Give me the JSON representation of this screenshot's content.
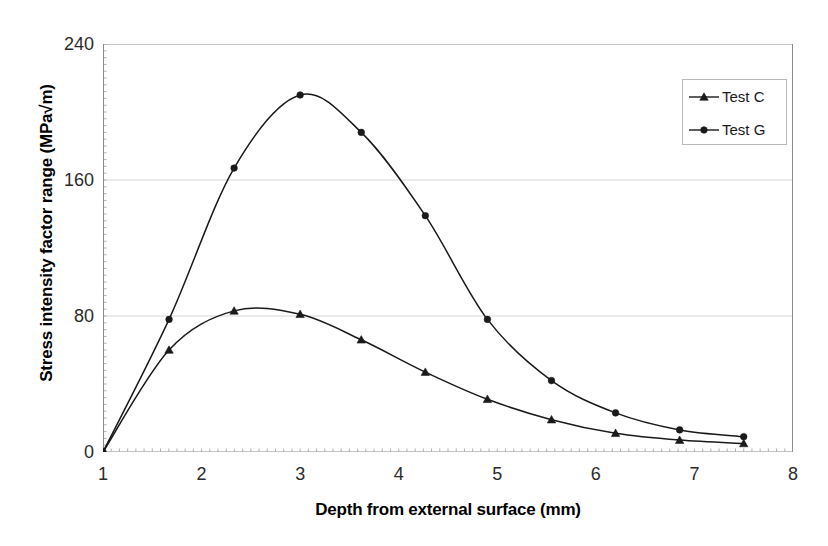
{
  "chart_data": {
    "type": "line",
    "title": "",
    "xlabel": "Depth from external surface (mm)",
    "ylabel": "Stress intensity factor range (MPa√m)",
    "xlim": [
      1,
      8
    ],
    "ylim": [
      0,
      240
    ],
    "xticks": [
      1,
      2,
      3,
      4,
      5,
      6,
      7,
      8
    ],
    "xtick_labels": [
      "1",
      "2",
      "3",
      "4",
      "5",
      "6",
      "7",
      "8"
    ],
    "yticks": [
      0,
      80,
      160,
      240
    ],
    "ytick_labels": [
      "0",
      "80",
      "160",
      "240"
    ],
    "grid": "horizontal",
    "legend_position": "top-right",
    "series": [
      {
        "name": "Test C",
        "marker": "triangle",
        "color": "#1a1a1a",
        "points": [
          {
            "x": 1.0,
            "y": 0
          },
          {
            "x": 1.67,
            "y": 60
          },
          {
            "x": 2.33,
            "y": 83
          },
          {
            "x": 3.0,
            "y": 81
          },
          {
            "x": 3.62,
            "y": 66
          },
          {
            "x": 4.27,
            "y": 47
          },
          {
            "x": 4.9,
            "y": 31
          },
          {
            "x": 5.55,
            "y": 19
          },
          {
            "x": 6.2,
            "y": 11
          },
          {
            "x": 6.85,
            "y": 7
          },
          {
            "x": 7.5,
            "y": 5
          }
        ]
      },
      {
        "name": "Test G",
        "marker": "circle",
        "color": "#1a1a1a",
        "points": [
          {
            "x": 1.0,
            "y": 0
          },
          {
            "x": 1.67,
            "y": 78
          },
          {
            "x": 2.33,
            "y": 167
          },
          {
            "x": 3.0,
            "y": 210
          },
          {
            "x": 3.62,
            "y": 188
          },
          {
            "x": 4.27,
            "y": 139
          },
          {
            "x": 4.9,
            "y": 78
          },
          {
            "x": 5.55,
            "y": 42
          },
          {
            "x": 6.2,
            "y": 23
          },
          {
            "x": 6.85,
            "y": 13
          },
          {
            "x": 7.5,
            "y": 9
          }
        ]
      }
    ]
  },
  "axes": {
    "x_title": "Depth from external surface (mm)",
    "y_title": "Stress intensity factor range (MPa√m)"
  },
  "legend": {
    "entries": [
      {
        "label": "Test C",
        "marker": "triangle"
      },
      {
        "label": "Test G",
        "marker": "circle"
      }
    ]
  }
}
